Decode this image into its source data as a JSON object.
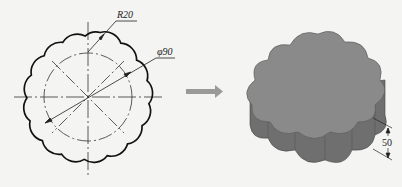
{
  "drawing": {
    "radius_label": "R20",
    "diameter_label": "φ90",
    "height_label": "50",
    "lobe_count": 10
  },
  "colors": {
    "outline": "#222222",
    "solid_top": "#8a8a8a",
    "solid_side": "#747474",
    "arrow": "#9a9a9a",
    "background": "#f4f4f2"
  }
}
